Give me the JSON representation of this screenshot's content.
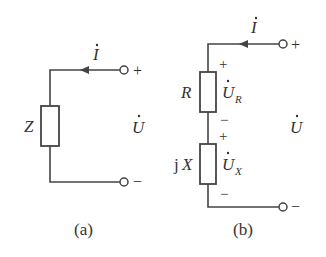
{
  "diagram_a": {
    "caption": "(a)",
    "impedance_label": "Z",
    "current_label": "I",
    "voltage_label": "U",
    "plus": "+",
    "minus": "−"
  },
  "diagram_b": {
    "caption": "(b)",
    "current_label": "I",
    "voltage_label": "U",
    "resistor_label": "R",
    "resistor_voltage": "U",
    "resistor_voltage_sub": "R",
    "reactance_label_j": "j",
    "reactance_label_x": "X",
    "reactance_voltage": "U",
    "reactance_voltage_sub": "X",
    "plus": "+",
    "minus": "−"
  }
}
